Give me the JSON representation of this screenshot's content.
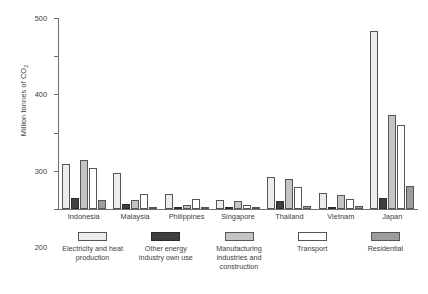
{
  "chart_data": {
    "type": "bar",
    "title": "",
    "xlabel": "",
    "ylabel": "Million tonnes of CO",
    "ylabel_sub": "2",
    "ylim": [
      0,
      500
    ],
    "yticks": [
      0,
      100,
      200,
      300,
      400,
      500
    ],
    "ytick_labels": [
      "0",
      "100",
      "200",
      "300",
      "400",
      "500"
    ],
    "grid": false,
    "legend_position": "bottom",
    "categories": [
      "Indonesia",
      "Malaysia",
      "Philippines",
      "Singapore",
      "Thailand",
      "Vietnam",
      "Japan"
    ],
    "series": [
      {
        "name": "Electricity and heat production",
        "color": "#ececec",
        "values": [
          118,
          93,
          39,
          24,
          85,
          43,
          465
        ]
      },
      {
        "name": "Other energy industry own use",
        "color": "#3f3f3f",
        "values": [
          30,
          13,
          6,
          5,
          20,
          6,
          30
        ]
      },
      {
        "name": "Manufacturing industries and construction",
        "color": "#c4c4c4",
        "values": [
          128,
          24,
          11,
          20,
          79,
          37,
          245
        ]
      },
      {
        "name": "Transport",
        "color": "#ffffff",
        "values": [
          107,
          38,
          26,
          10,
          57,
          26,
          220
        ]
      },
      {
        "name": "Residential",
        "color": "#9c9c9c",
        "values": [
          24,
          6,
          4,
          2,
          7,
          9,
          60
        ]
      }
    ]
  },
  "legend": {
    "items": [
      {
        "label": "Electricity and heat production",
        "swatch": "s0"
      },
      {
        "label": "Other energy industry own use",
        "swatch": "s1"
      },
      {
        "label": "Manufacturing industries and construction",
        "swatch": "s2"
      },
      {
        "label": "Transport",
        "swatch": "s3"
      },
      {
        "label": "Residential",
        "swatch": "s4"
      }
    ]
  },
  "caption": ""
}
